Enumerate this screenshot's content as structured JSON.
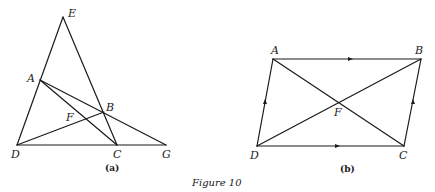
{
  "caption": "Figure 10",
  "figure_a": {
    "sublabel": "(a)",
    "points": {
      "E": {
        "label": "E"
      },
      "A": {
        "label": "A"
      },
      "B": {
        "label": "B"
      },
      "F": {
        "label": "F"
      },
      "D": {
        "label": "D"
      },
      "C": {
        "label": "C"
      },
      "G": {
        "label": "G"
      }
    },
    "segments": [
      "D-E",
      "E-C",
      "D-G",
      "A-G",
      "A-C",
      "D-B"
    ]
  },
  "figure_b": {
    "sublabel": "(b)",
    "points": {
      "A": {
        "label": "A"
      },
      "B": {
        "label": "B"
      },
      "C": {
        "label": "C"
      },
      "D": {
        "label": "D"
      },
      "F": {
        "label": "F"
      }
    },
    "segments": [
      "A-B",
      "B-C",
      "C-D",
      "D-A",
      "A-C",
      "D-B"
    ],
    "parallel_markers": [
      "A-B",
      "D-C",
      "D-A",
      "C-B"
    ]
  },
  "colors": {
    "ink": "#1a1a1a",
    "background": "#ffffff"
  }
}
